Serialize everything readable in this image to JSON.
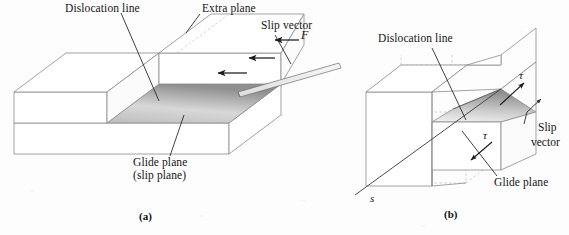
{
  "figure": {
    "title_type": "edge-and-screw-dislocation-diagram",
    "background_color": "#fdfdfd",
    "line_color": "#7a7a7a",
    "dash_color": "#b9b9b9",
    "leader_color": "#2b2b2b",
    "shade_light": "#efefef",
    "shade_dark": "#9a9a9a"
  },
  "panel_a": {
    "id": "(a)",
    "labels": {
      "dislocation_line": "Dislocation line",
      "extra_plane": "Extra plane",
      "slip_vector": "Slip vector",
      "force": "F",
      "glide_plane_line1": "Glide plane",
      "glide_plane_line2": "(slip plane)"
    },
    "arrows": {
      "force_arrow_count": 3,
      "force_direction": "left"
    }
  },
  "panel_b": {
    "id": "(b)",
    "labels": {
      "dislocation_line": "Dislocation line",
      "slip_vector_line1": "Slip",
      "slip_vector_line2": "vector",
      "glide_plane": "Glide plane",
      "line_vector": "s",
      "shear_upper": "τ",
      "shear_lower": "τ"
    },
    "arrows": {
      "shear_upper_direction": "up-right",
      "shear_lower_direction": "down-left"
    }
  }
}
